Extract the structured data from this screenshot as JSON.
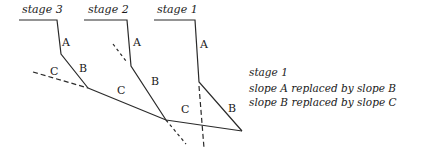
{
  "stages": [
    {
      "label": "stage 3",
      "x": 22,
      "y": 13
    },
    {
      "label": "stage 2",
      "x": 88,
      "y": 13
    },
    {
      "label": "stage 1",
      "x": 157,
      "y": 13
    }
  ],
  "slope_labels": {
    "stage3_A": "A",
    "stage3_B": "B",
    "stage3_C": "C",
    "stage2_A": "A",
    "stage2_B": "B",
    "stage2_C": "C",
    "stage1_A": "A",
    "stage1_B": "B",
    "stage1_C": "C"
  },
  "legend": {
    "title": "stage 1",
    "line1": "slope A replaced by slope B",
    "line2": "slope B replaced by slope C"
  },
  "colors": {
    "line": "#2a2a2a",
    "text": "#1a1a1a",
    "background": "#ffffff"
  }
}
